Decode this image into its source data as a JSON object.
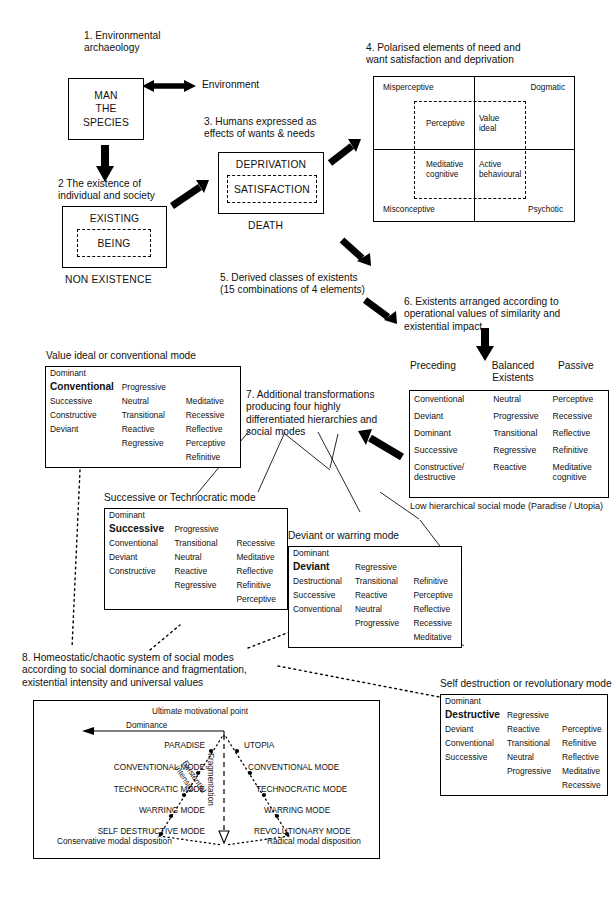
{
  "diagram": {
    "title_sections": {
      "s1": "1. Environmental\narchaeology",
      "s2": "2 The existence of\nindividual and society",
      "s3": "3. Humans expressed as\neffects of wants & needs",
      "s4": "4. Polarised elements of need and\nwant satisfaction and deprivation",
      "s5": "5. Derived classes of existents\n(15 combinations of 4 elements)",
      "s6": "6. Existents arranged according to\noperational values of similarity and\nexistential impact",
      "s7": "7. Additional transformations\nproducing four highly\ndifferentiated hierarchies and\nsocial modes",
      "s8": "8. Homeostatic/chaotic system of social modes\naccording to social dominance and fragmentation,\nexistential intensity and universal values"
    },
    "man_box": {
      "lines": "MAN\nTHE\nSPECIES"
    },
    "environment_label": "Environment",
    "existence_box": {
      "outer": "EXISTING",
      "inner": "BEING",
      "caption": "NON EXISTENCE"
    },
    "deprivation_box": {
      "outer": "DEPRIVATION",
      "inner": "SATISFACTION",
      "caption": "DEATH"
    },
    "quadrant": {
      "top_left": "Misperceptive",
      "top_right": "Dogmatic",
      "bottom_left": "Misconceptive",
      "bottom_right": "Psychotic",
      "inner_tl": "Perceptive",
      "inner_tr": "Value\nideal",
      "inner_bl": "Meditative\ncognitive",
      "inner_br": "Active\nbehavioural"
    },
    "existents": {
      "col_headers": [
        "Preceding",
        "Balanced\nExistents",
        "Passive"
      ],
      "rows": [
        [
          "Conventional",
          "Neutral",
          "Perceptive"
        ],
        [
          "Deviant",
          "Progressive",
          "Recessive"
        ],
        [
          "Dominant",
          "Transitional",
          "Reflective"
        ],
        [
          "Successive",
          "Regressive",
          "Refinitive"
        ],
        [
          "Constructive/\ndestructive",
          "Reactive",
          "Meditative\ncognitive"
        ]
      ],
      "caption": "Low hierarchical social mode (Paradise / Utopia)"
    },
    "modes": [
      {
        "id": "value-ideal",
        "title": "Value ideal or conventional mode",
        "top": "Dominant",
        "head": "Conventional",
        "head_right": "Progressive",
        "rows": [
          [
            "Successive",
            "Neutral",
            "Meditative"
          ],
          [
            "Constructive",
            "Transitional",
            "Recessive"
          ],
          [
            "Deviant",
            "Reactive",
            "Reflective"
          ],
          [
            "",
            "Regressive",
            "Perceptive"
          ],
          [
            "",
            "",
            "Refinitive"
          ]
        ]
      },
      {
        "id": "successive",
        "title": "Successive or Technocratic mode",
        "top": "Dominant",
        "head": "Successive",
        "head_right": "Progressive",
        "rows": [
          [
            "Conventional",
            "Transitional",
            "Recessive"
          ],
          [
            "Deviant",
            "Neutral",
            "Meditative"
          ],
          [
            "Constructive",
            "Reactive",
            "Reflective"
          ],
          [
            "",
            "Regressive",
            "Refinitive"
          ],
          [
            "",
            "",
            "Perceptive"
          ]
        ]
      },
      {
        "id": "deviant",
        "title": "Deviant or warring mode",
        "top": "Dominant",
        "head": "Deviant",
        "head_right": "Regressive",
        "rows": [
          [
            "Destructional",
            "Transitional",
            "Refinitive"
          ],
          [
            "Successive",
            "Reactive",
            "Perceptive"
          ],
          [
            "Conventional",
            "Neutral",
            "Reflective"
          ],
          [
            "",
            "Progressive",
            "Recessive"
          ],
          [
            "",
            "",
            "Meditative"
          ]
        ]
      },
      {
        "id": "destructive",
        "title": "Self destruction or revolutionary mode",
        "top": "Dominant",
        "head": "Destructive",
        "head_right": "Regressive",
        "rows": [
          [
            "Deviant",
            "Reactive",
            "Perceptive"
          ],
          [
            "Conventional",
            "Transitional",
            "Refinitive"
          ],
          [
            "Successive",
            "Neutral",
            "Reflective"
          ],
          [
            "",
            "Progressive",
            "Meditative"
          ],
          [
            "",
            "",
            "Recessive"
          ]
        ]
      }
    ],
    "homeostatic": {
      "ultimate": "Ultimate motivational point",
      "dominance": "Dominance",
      "fragmentation": "Fragmentation",
      "existential_intensity": "Existential\nintensity",
      "left_modes": [
        "PARADISE",
        "CONVENTIONAL MODE",
        "TECHNOCRATIC MODE",
        "WARRING MODE",
        "SELF DESTRUCTIVE MODE"
      ],
      "right_modes": [
        "UTOPIA",
        "CONVENTIONAL MODE",
        "TECHNOCRATIC MODE",
        "WARRING MODE",
        "REVOLUTIONARY MODE"
      ],
      "left_caption": "Conservative modal disposition",
      "right_caption": "Radical modal disposition"
    },
    "colors": {
      "ink": "#111111",
      "line": "#000000",
      "paper": "#ffffff"
    }
  }
}
